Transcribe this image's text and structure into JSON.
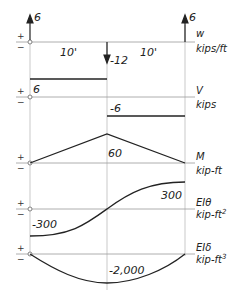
{
  "diagram": {
    "title": "",
    "loads": {
      "left_reaction": "6",
      "right_reaction": "6",
      "point_load": "-12",
      "span_left": "10'",
      "span_right": "10'"
    },
    "rows": [
      {
        "id": "w",
        "label": "w",
        "unit": "kips/ft"
      },
      {
        "id": "V",
        "label": "V",
        "unit": "kips",
        "values": [
          "6",
          "-6"
        ]
      },
      {
        "id": "M",
        "label": "M",
        "unit": "kip-ft",
        "values": [
          "60"
        ]
      },
      {
        "id": "theta",
        "label": "EIθ",
        "unit": "kip-ft",
        "unit_exp": "2",
        "values": [
          "-300",
          "300"
        ]
      },
      {
        "id": "delta",
        "label": "EIδ",
        "unit": "kip-ft",
        "unit_exp": "3",
        "values": [
          "-2,000"
        ]
      }
    ],
    "signs": {
      "plus": "+",
      "minus": "−"
    }
  }
}
